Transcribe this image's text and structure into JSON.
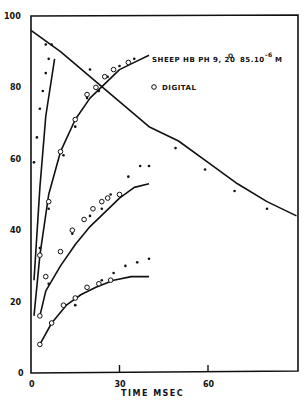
{
  "chart_data": {
    "type": "scatter",
    "title": "",
    "legend": {
      "sample": "SHEEP HB PH 9, 20° 85.10^-6 M",
      "sample_main": "SHEEP HB  PH 9, 20",
      "sample_deg": "O",
      "sample_conc": "85.10",
      "sample_exp": "-6",
      "sample_unit": "M",
      "digital_label": "DIGITAL",
      "position": "upper right inside plot"
    },
    "xlabel": "TIME   MSEC",
    "ylabel": "",
    "xlim": [
      0,
      90
    ],
    "ylim": [
      0,
      100
    ],
    "x_ticks": [
      0,
      30,
      60
    ],
    "y_ticks": [
      0,
      20,
      40,
      60,
      80,
      100
    ],
    "grid": false,
    "series": [
      {
        "name": "decay line (filled dots)",
        "line": [
          [
            0,
            96
          ],
          [
            10,
            90
          ],
          [
            20,
            83
          ],
          [
            30,
            76
          ],
          [
            40,
            69
          ],
          [
            50,
            65
          ],
          [
            60,
            59
          ],
          [
            70,
            53
          ],
          [
            80,
            48
          ],
          [
            90,
            44
          ]
        ],
        "dots": [
          [
            5,
            92
          ],
          [
            20,
            85
          ],
          [
            49,
            63
          ],
          [
            59,
            57
          ],
          [
            69,
            51
          ],
          [
            80,
            46
          ]
        ]
      },
      {
        "name": "curve 1 (filled dots)",
        "line": [
          [
            1,
            26
          ],
          [
            3,
            52
          ],
          [
            5,
            72
          ],
          [
            8,
            88
          ]
        ],
        "dots": [
          [
            1,
            59
          ],
          [
            2,
            66
          ],
          [
            3,
            74
          ],
          [
            4,
            79
          ],
          [
            5,
            84
          ],
          [
            6,
            88
          ],
          [
            7,
            92
          ]
        ]
      },
      {
        "name": "curve 2",
        "line": [
          [
            1,
            16
          ],
          [
            3,
            33
          ],
          [
            6,
            50
          ],
          [
            10,
            62
          ],
          [
            15,
            71
          ],
          [
            20,
            77
          ],
          [
            25,
            81
          ],
          [
            30,
            85
          ],
          [
            35,
            87
          ],
          [
            40,
            89
          ]
        ],
        "digital": [
          [
            3,
            33
          ],
          [
            6,
            48
          ],
          [
            10,
            62
          ],
          [
            15,
            71
          ],
          [
            19,
            78
          ],
          [
            22,
            80
          ],
          [
            25,
            83
          ],
          [
            28,
            85
          ],
          [
            33,
            87
          ]
        ],
        "dots": [
          [
            3,
            35
          ],
          [
            6,
            46
          ],
          [
            11,
            61
          ],
          [
            15,
            69
          ],
          [
            19,
            77
          ],
          [
            23,
            79
          ],
          [
            26,
            83
          ],
          [
            30,
            86
          ],
          [
            35,
            88
          ]
        ]
      },
      {
        "name": "curve 3",
        "line": [
          [
            3,
            16
          ],
          [
            5,
            23
          ],
          [
            10,
            30
          ],
          [
            15,
            36
          ],
          [
            20,
            41
          ],
          [
            25,
            45
          ],
          [
            30,
            49
          ],
          [
            35,
            52
          ],
          [
            40,
            53
          ]
        ],
        "digital": [
          [
            3,
            16
          ],
          [
            5,
            27
          ],
          [
            10,
            34
          ],
          [
            14,
            40
          ],
          [
            18,
            43
          ],
          [
            21,
            46
          ],
          [
            24,
            48
          ],
          [
            26,
            49
          ],
          [
            30,
            50
          ]
        ],
        "dots": [
          [
            6,
            25
          ],
          [
            14,
            39
          ],
          [
            20,
            44
          ],
          [
            24,
            46
          ],
          [
            27,
            50
          ],
          [
            30,
            50
          ],
          [
            33,
            55
          ],
          [
            37,
            58
          ],
          [
            40,
            58
          ]
        ]
      },
      {
        "name": "curve 4",
        "line": [
          [
            3,
            8
          ],
          [
            7,
            14
          ],
          [
            12,
            19
          ],
          [
            17,
            22
          ],
          [
            22,
            24
          ],
          [
            28,
            26
          ],
          [
            34,
            27
          ],
          [
            40,
            27
          ]
        ],
        "digital": [
          [
            3,
            8
          ],
          [
            7,
            14
          ],
          [
            11,
            19
          ],
          [
            15,
            21
          ],
          [
            19,
            24
          ],
          [
            23,
            25
          ],
          [
            27,
            26
          ]
        ],
        "dots": [
          [
            15,
            19
          ],
          [
            24,
            26
          ],
          [
            28,
            28
          ],
          [
            32,
            30
          ],
          [
            36,
            31
          ],
          [
            40,
            32
          ]
        ]
      }
    ]
  }
}
